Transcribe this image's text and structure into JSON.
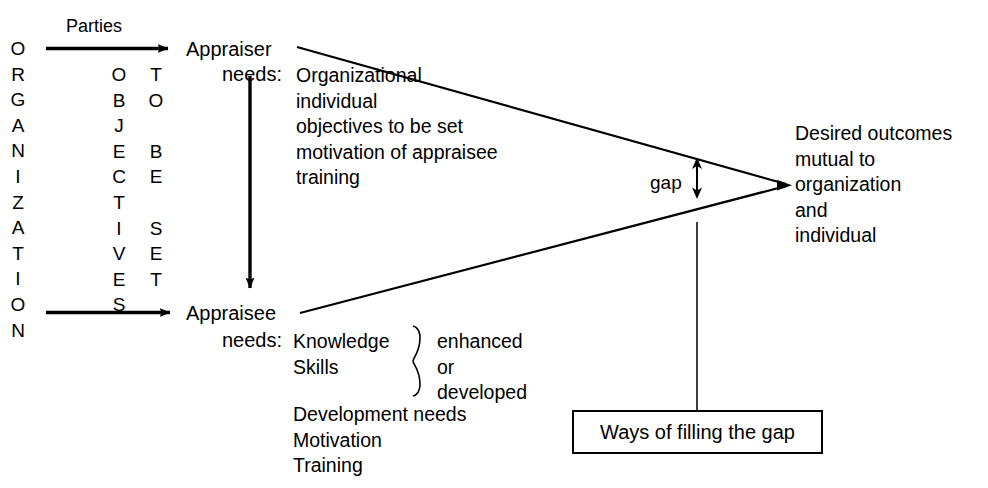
{
  "diagram": {
    "stroke_color": "#000000",
    "background_color": "#ffffff"
  },
  "left": {
    "organization_label": "ORGANIZATION",
    "organization_letters": "O\nR\nG\nA\nN\nI\nZ\nA\nT\nI\nO\nN",
    "objectives_letters": "O\nB\nJ\nE\nC\nT\nI\nV\nE\nS",
    "to_be_set_letters": "T\nO\n \nB\nE\n \nS\nE\nT",
    "parties_label": "Parties"
  },
  "appraiser": {
    "heading": "Appraiser",
    "needs_label": "needs:",
    "items": [
      "Organizational",
      "individual",
      "objectives to be set",
      "motivation of appraisee",
      "training"
    ],
    "items_text": "Organizational\nindividual\nobjectives to be set\nmotivation of appraisee\ntraining"
  },
  "appraisee": {
    "heading": "Appraisee",
    "needs_label": "needs:",
    "braced_items": [
      "Knowledge",
      "Skills"
    ],
    "braced_items_text": "Knowledge\nSkills",
    "brace_outcomes": [
      "enhanced",
      "or",
      "developed"
    ],
    "brace_outcomes_text": "enhanced\nor\ndeveloped",
    "other_items": [
      "Development needs",
      "Motivation",
      "Training"
    ],
    "other_items_text": "Development needs\nMotivation\nTraining"
  },
  "gap": {
    "label": "gap"
  },
  "outcome": {
    "lines": [
      "Desired outcomes",
      "mutual to",
      "organization",
      "and",
      "individual"
    ],
    "text": "Desired outcomes\nmutual to\norganization\nand\nindividual"
  },
  "ways_box": {
    "label": "Ways of filling the gap"
  }
}
